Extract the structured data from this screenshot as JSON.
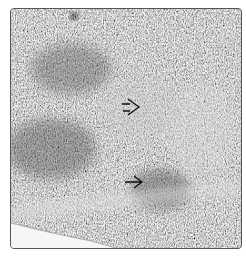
{
  "image": {
    "type": "micrograph",
    "description": "Grayscale histology section with dense fibrous tissue texture",
    "caption": "",
    "colors": {
      "base": "#9a9a9a",
      "dark_region": "#555555",
      "light_region": "#e8e8e8",
      "arrow": "#111111"
    }
  },
  "annotations": {
    "arrows": [
      {
        "label": "arrow-upper",
        "direction": "right",
        "x": 121,
        "y": 106
      },
      {
        "label": "arrow-lower",
        "direction": "right",
        "x": 121,
        "y": 181
      }
    ]
  }
}
